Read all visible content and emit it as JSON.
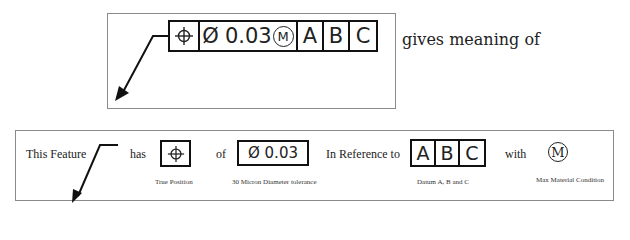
{
  "top_panel": {
    "feature_control_frame": {
      "symbol_icon": "position-crosshair-icon",
      "diameter_symbol": "Ø",
      "tolerance": "0.03",
      "modifier": "M",
      "datums": [
        "A",
        "B",
        "C"
      ]
    },
    "caption": "gives meaning of"
  },
  "bottom_panel": {
    "phrases": {
      "feature": "This Feature",
      "has": "has",
      "of": "of",
      "reference": "In Reference to",
      "with": "with"
    },
    "position_box": {
      "symbol_icon": "position-crosshair-icon",
      "caption": "True Position"
    },
    "tolerance_box": {
      "value": "Ø 0.03",
      "caption": "30 Micron Diameter tolerance"
    },
    "datum_box": {
      "datums": [
        "A",
        "B",
        "C"
      ],
      "caption": "Datum A, B and C"
    },
    "modifier": {
      "symbol": "M",
      "caption": "Max Material Condition"
    }
  },
  "colors": {
    "line": "#111111",
    "frame_border": "#8a8a8a",
    "text": "#222222"
  }
}
